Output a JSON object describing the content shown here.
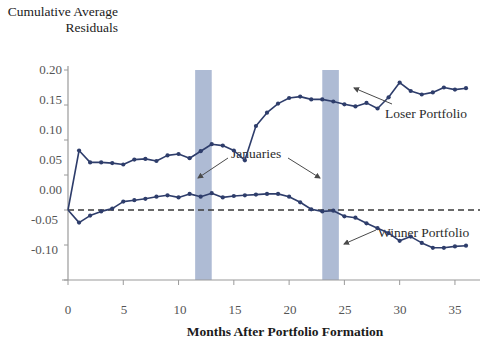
{
  "chart_data": {
    "type": "line",
    "title": "Cumulative Average Residuals",
    "ylabel": "Cumulative Average Residuals",
    "xlabel": "Months After Portfolio Formation",
    "xlim": [
      0,
      36
    ],
    "ylim": [
      -0.1,
      0.2
    ],
    "yticks": [
      "0.20",
      "0.15",
      "0.10",
      "0.05",
      "0.00",
      "-0.05",
      "-0.10"
    ],
    "ytick_values": [
      0.2,
      0.15,
      0.1,
      0.05,
      0.0,
      -0.05,
      -0.1
    ],
    "xticks": [
      "0",
      "5",
      "10",
      "15",
      "20",
      "25",
      "30",
      "35"
    ],
    "xtick_values": [
      0,
      5,
      10,
      15,
      20,
      25,
      30,
      35
    ],
    "grid": false,
    "legend_position": "inline-annotations",
    "zero_line": 0.0,
    "zero_line_style": "dashed",
    "shaded_bands": [
      {
        "label": "Januaries",
        "x_start": 11.5,
        "x_end": 13.0
      },
      {
        "label": "Januaries",
        "x_start": 23.0,
        "x_end": 24.5
      }
    ],
    "annotations": [
      {
        "text": "Januaries",
        "x": 17.0,
        "y": 0.047
      },
      {
        "text": "Loser Portfolio",
        "x": 29.5,
        "y": 0.128
      },
      {
        "text": "Winner Portfolio",
        "x": 28.5,
        "y": -0.027
      }
    ],
    "series": [
      {
        "name": "Loser Portfolio",
        "color": "#2e3d6b",
        "x": [
          0,
          1,
          2,
          3,
          4,
          5,
          6,
          7,
          8,
          9,
          10,
          11,
          12,
          13,
          14,
          15,
          16,
          17,
          18,
          19,
          20,
          21,
          22,
          23,
          24,
          25,
          26,
          27,
          28,
          29,
          30,
          31,
          32,
          33,
          34,
          35,
          36
        ],
        "values": [
          0.0,
          0.085,
          0.068,
          0.068,
          0.067,
          0.065,
          0.072,
          0.073,
          0.07,
          0.078,
          0.08,
          0.074,
          0.084,
          0.094,
          0.092,
          0.085,
          0.071,
          0.12,
          0.139,
          0.152,
          0.16,
          0.162,
          0.158,
          0.158,
          0.155,
          0.151,
          0.148,
          0.153,
          0.145,
          0.161,
          0.182,
          0.17,
          0.165,
          0.168,
          0.175,
          0.172,
          0.174
        ]
      },
      {
        "name": "Winner Portfolio",
        "color": "#2e3d6b",
        "x": [
          0,
          1,
          2,
          3,
          4,
          5,
          6,
          7,
          8,
          9,
          10,
          11,
          12,
          13,
          14,
          15,
          16,
          17,
          18,
          19,
          20,
          21,
          22,
          23,
          24,
          25,
          26,
          27,
          28,
          29,
          30,
          31,
          32,
          33,
          34,
          35,
          36
        ],
        "values": [
          0.0,
          -0.018,
          -0.008,
          -0.002,
          0.002,
          0.012,
          0.014,
          0.016,
          0.019,
          0.021,
          0.018,
          0.023,
          0.019,
          0.024,
          0.018,
          0.02,
          0.021,
          0.022,
          0.023,
          0.023,
          0.019,
          0.011,
          0.001,
          -0.002,
          -0.001,
          -0.009,
          -0.011,
          -0.019,
          -0.026,
          -0.033,
          -0.044,
          -0.038,
          -0.047,
          -0.054,
          -0.054,
          -0.052,
          -0.051
        ]
      }
    ],
    "loser_tail_x": [
      24,
      25,
      26,
      27,
      28,
      29,
      30,
      31,
      32,
      33,
      34,
      35,
      36
    ],
    "note": "second_half_loser_values_continue"
  },
  "chart_meta": {
    "band_color": "#aebbd4",
    "line_color": "#2e3d6b",
    "axis_color": "#9a9a9a",
    "marker_shape": "circle"
  }
}
